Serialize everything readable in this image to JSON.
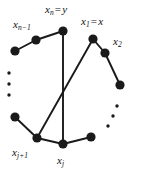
{
  "figure": {
    "type": "cycle-graph-with-chords",
    "background_color": "#ffffff",
    "ink_color": "#1a1a1a",
    "width": 141,
    "height": 173
  },
  "labels": {
    "x_n_equals_y": {
      "base": "x",
      "sub": "n",
      "op": "=",
      "rhs": "y",
      "x": 45,
      "y": 4
    },
    "x_n_minus_1": {
      "base": "x",
      "sub": "n−1",
      "x": 13,
      "y": 19
    },
    "x_1_equals_x": {
      "base": "x",
      "sub": "1",
      "op": "=",
      "rhs": "x",
      "x": 81,
      "y": 16
    },
    "x_2": {
      "base": "x",
      "sub": "2",
      "x": 113,
      "y": 36
    },
    "x_j_plus_1": {
      "base": "x",
      "sub": "j+1",
      "x": 12,
      "y": 147
    },
    "x_j": {
      "base": "x",
      "sub": "j",
      "x": 57,
      "y": 155
    }
  },
  "nodes": [
    {
      "name": "x-n-node",
      "cx": 63,
      "cy": 31,
      "r": 4.6
    },
    {
      "name": "x-n-minus-1-node",
      "cx": 36,
      "cy": 40,
      "r": 4.6
    },
    {
      "name": "left-upper-node",
      "cx": 15,
      "cy": 51,
      "r": 4.6
    },
    {
      "name": "left-lower-node",
      "cx": 15,
      "cy": 117,
      "r": 4.6
    },
    {
      "name": "x-j-plus-1-node",
      "cx": 37,
      "cy": 138,
      "r": 4.6
    },
    {
      "name": "x-j-node",
      "cx": 63,
      "cy": 144,
      "r": 4.6
    },
    {
      "name": "bottom-right-node",
      "cx": 91,
      "cy": 137,
      "r": 4.6
    },
    {
      "name": "right-lower-node",
      "cx": 120,
      "cy": 85,
      "r": 4.6
    },
    {
      "name": "x-2-node",
      "cx": 105,
      "cy": 53,
      "r": 4.6
    },
    {
      "name": "x-1-node",
      "cx": 93,
      "cy": 39,
      "r": 4.6
    }
  ],
  "cycle_edges": [
    {
      "from": "x-n-node",
      "to": "x-n-minus-1-node"
    },
    {
      "from": "x-n-minus-1-node",
      "to": "left-upper-node"
    },
    {
      "from": "left-lower-node",
      "to": "x-j-plus-1-node"
    },
    {
      "from": "x-j-plus-1-node",
      "to": "x-j-node"
    },
    {
      "from": "x-j-node",
      "to": "bottom-right-node"
    },
    {
      "from": "right-lower-node",
      "to": "x-2-node"
    },
    {
      "from": "x-2-node",
      "to": "x-1-node"
    }
  ],
  "chords": [
    {
      "name": "chord-xn-xj",
      "from": "x-n-node",
      "to": "x-j-node"
    },
    {
      "name": "chord-x1-xjplus1",
      "from": "x-1-node",
      "to": "x-j-plus-1-node"
    }
  ],
  "ellipses": [
    {
      "name": "left-ellipsis",
      "dots": [
        {
          "cx": 9,
          "cy": 73,
          "r": 1.7
        },
        {
          "cx": 9,
          "cy": 84,
          "r": 1.7
        },
        {
          "cx": 9,
          "cy": 95,
          "r": 1.7
        }
      ]
    },
    {
      "name": "right-ellipsis",
      "dots": [
        {
          "cx": 117,
          "cy": 106,
          "r": 1.7
        },
        {
          "cx": 113,
          "cy": 116,
          "r": 1.7
        },
        {
          "cx": 108,
          "cy": 126,
          "r": 1.7
        }
      ]
    }
  ]
}
